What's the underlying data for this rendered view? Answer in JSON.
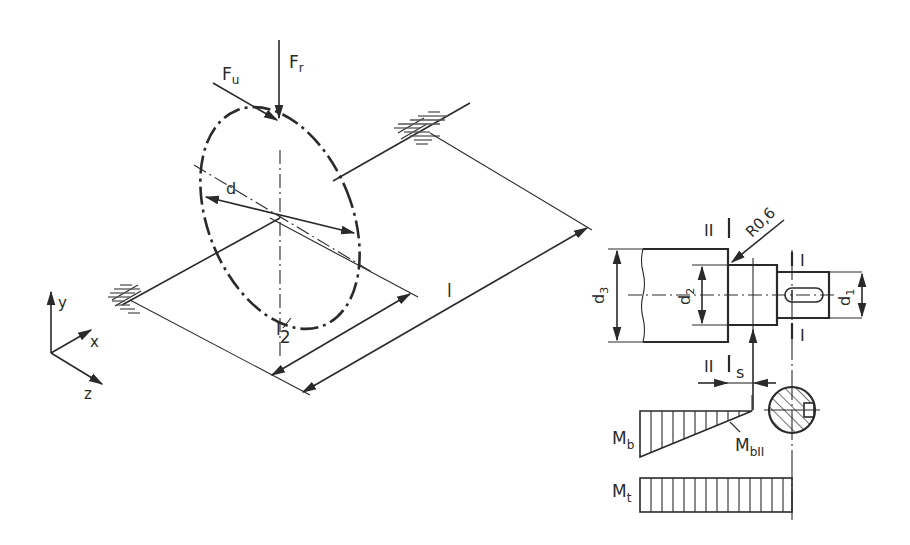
{
  "diagram": {
    "colors": {
      "ink": "#2a2a2a",
      "background": "#ffffff"
    },
    "isometric_view": {
      "forces": {
        "circumferential": "F",
        "circumferential_sub": "u",
        "radial": "F",
        "radial_sub": "r"
      },
      "gear_diameter_label": "d",
      "length_label": "l",
      "half_length_label": "l",
      "half_length_denominator": "2",
      "axes": {
        "x": "x",
        "y": "y",
        "z": "z"
      }
    },
    "shaft_detail": {
      "section_I_label": "I",
      "section_II_label": "II",
      "fillet_radius_label": "R0,6",
      "diameters": [
        {
          "label": "d",
          "sub": "1"
        },
        {
          "label": "d",
          "sub": "2"
        },
        {
          "label": "d",
          "sub": "3"
        }
      ],
      "distance_label": "s"
    },
    "moment_diagrams": {
      "bending": {
        "label": "M",
        "sub": "b"
      },
      "bending_at_II": {
        "label": "M",
        "sub": "bII"
      },
      "torsion": {
        "label": "M",
        "sub": "t"
      }
    }
  }
}
